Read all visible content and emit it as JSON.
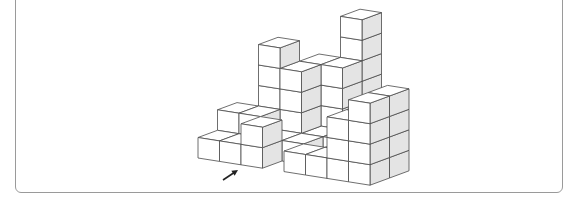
{
  "figure": {
    "colors": {
      "top_face": "#ffffff",
      "front_face": "#ffffff",
      "side_face": "#e4e4e4",
      "edge": "#4a4a4a",
      "frame_border": "#9a9a9a"
    },
    "projection": {
      "origin": [
        198,
        158
      ],
      "x_axis": [
        21.5,
        3.4
      ],
      "y_axis": [
        19.5,
        -7.2
      ],
      "z_axis": [
        0,
        -20.5
      ]
    },
    "cubes": [
      [
        0,
        0,
        0
      ],
      [
        1,
        0,
        0
      ],
      [
        2,
        0,
        0
      ],
      [
        2,
        0,
        1
      ],
      [
        0,
        1,
        0
      ],
      [
        1,
        1,
        0
      ],
      [
        0,
        1,
        1
      ],
      [
        1,
        1,
        1
      ],
      [
        1,
        2,
        0
      ],
      [
        1,
        2,
        1
      ],
      [
        1,
        2,
        2
      ],
      [
        1,
        2,
        3
      ],
      [
        1,
        2,
        4
      ],
      [
        2,
        2,
        0
      ],
      [
        2,
        2,
        1
      ],
      [
        2,
        2,
        2
      ],
      [
        2,
        2,
        3
      ],
      [
        2,
        3,
        0
      ],
      [
        2,
        3,
        1
      ],
      [
        2,
        3,
        2
      ],
      [
        2,
        3,
        3
      ],
      [
        3,
        4,
        0
      ],
      [
        3,
        4,
        1
      ],
      [
        3,
        4,
        2
      ],
      [
        3,
        4,
        3
      ],
      [
        3,
        4,
        4
      ],
      [
        3,
        4,
        5
      ],
      [
        3,
        3,
        0
      ],
      [
        3,
        3,
        1
      ],
      [
        3,
        3,
        2
      ],
      [
        3,
        3,
        3
      ],
      [
        2,
        1,
        0
      ],
      [
        3,
        1,
        0
      ],
      [
        3,
        2,
        0
      ],
      [
        4,
        2,
        0
      ],
      [
        4,
        3,
        0
      ],
      [
        4,
        0,
        0
      ],
      [
        5,
        0,
        0
      ],
      [
        6,
        0,
        0
      ],
      [
        7,
        0,
        0
      ],
      [
        6,
        0,
        1
      ],
      [
        6,
        0,
        2
      ],
      [
        7,
        0,
        1
      ],
      [
        7,
        0,
        2
      ],
      [
        7,
        0,
        3
      ],
      [
        7,
        1,
        0
      ],
      [
        7,
        1,
        1
      ],
      [
        7,
        1,
        2
      ],
      [
        7,
        1,
        3
      ],
      [
        6,
        1,
        0
      ],
      [
        6,
        1,
        1
      ],
      [
        6,
        1,
        2
      ],
      [
        5,
        1,
        0
      ],
      [
        5,
        2,
        0
      ],
      [
        6,
        2,
        0
      ],
      [
        6,
        2,
        1
      ],
      [
        6,
        2,
        2
      ]
    ],
    "arrow": {
      "from": [
        223,
        180
      ],
      "to": [
        238,
        170
      ],
      "label": ""
    }
  }
}
